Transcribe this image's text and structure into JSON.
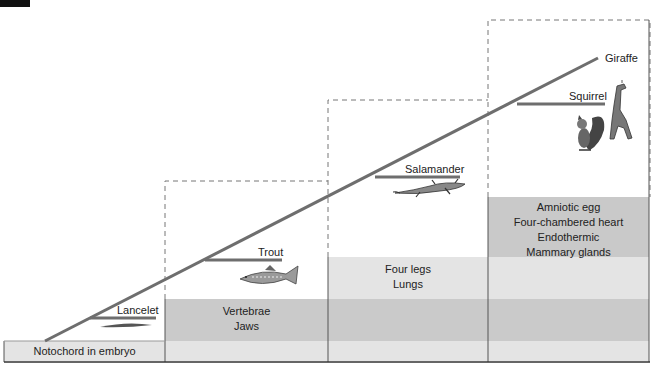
{
  "diagram": {
    "type": "cladogram",
    "taxa": [
      {
        "name": "Lancelet"
      },
      {
        "name": "Trout"
      },
      {
        "name": "Salamander"
      },
      {
        "name": "Squirrel"
      },
      {
        "name": "Giraffe"
      }
    ],
    "characters": [
      {
        "lines": [
          "Notochord in embryo"
        ]
      },
      {
        "lines": [
          "Vertebrae",
          "Jaws"
        ]
      },
      {
        "lines": [
          "Four legs",
          "Lungs"
        ]
      },
      {
        "lines": [
          "Amniotic egg",
          "Four-chambered heart",
          "Endothermic",
          "Mammary glands"
        ]
      }
    ],
    "colors": {
      "band_light": "#e4e4e4",
      "band_dark": "#c9c9c9",
      "line": "#6e6e6e",
      "border": "#444444"
    }
  }
}
